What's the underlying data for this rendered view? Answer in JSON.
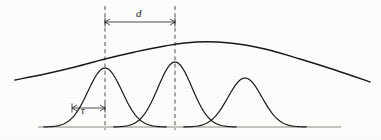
{
  "figure": {
    "type": "line-diagram",
    "background_color": "#fdfdfb",
    "ink_color": "#1a1a1a",
    "width": 381,
    "height": 140,
    "labels": {
      "pulse_spacing": "d",
      "pulse_width": "τ"
    },
    "annotations": [
      {
        "name": "spacing-dimension",
        "label": "d",
        "style": "double-headed-arrow",
        "x_start": 105,
        "x_end": 175,
        "y": 22
      },
      {
        "name": "width-dimension",
        "label": "τ",
        "style": "double-headed-arrow",
        "x_start": 72,
        "x_end": 105,
        "y": 108
      }
    ],
    "dashed_lines": [
      {
        "name": "dashed-line-left",
        "x": 105,
        "y_top": 6,
        "y_bottom": 130
      },
      {
        "name": "dashed-line-right",
        "x": 175,
        "y_top": 6,
        "y_bottom": 130
      }
    ],
    "baseline": {
      "x_start": 38,
      "x_end": 341,
      "y": 127
    }
  },
  "chart_data": {
    "type": "line",
    "title": "",
    "xlabel": "",
    "ylabel": "",
    "grid": false,
    "legend": "none",
    "xlim": [
      0,
      381
    ],
    "ylim": [
      140,
      0
    ],
    "series": [
      {
        "name": "envelope",
        "description": "broad modulating envelope curve over the pulse train",
        "type": "curve",
        "peak_x": 196,
        "peak_y": 42,
        "points": [
          [
            15,
            80
          ],
          [
            45,
            74
          ],
          [
            75,
            67
          ],
          [
            105,
            59
          ],
          [
            135,
            52
          ],
          [
            165,
            46
          ],
          [
            196,
            42
          ],
          [
            230,
            43
          ],
          [
            265,
            49
          ],
          [
            300,
            59
          ],
          [
            335,
            70
          ],
          [
            370,
            82
          ]
        ]
      },
      {
        "name": "pulse-1",
        "description": "first gaussian pulse",
        "type": "gaussian",
        "center": 105,
        "peak_y": 68,
        "baseline_y": 127,
        "sigma": 17
      },
      {
        "name": "pulse-2",
        "description": "second gaussian pulse, centred on right dashed line",
        "type": "gaussian",
        "center": 175,
        "peak_y": 62,
        "baseline_y": 127,
        "sigma": 17
      },
      {
        "name": "pulse-3",
        "description": "third gaussian pulse",
        "type": "gaussian",
        "center": 245,
        "peak_y": 78,
        "baseline_y": 127,
        "sigma": 17
      }
    ]
  }
}
